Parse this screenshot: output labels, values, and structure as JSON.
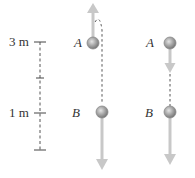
{
  "diagram": {
    "scale": {
      "top_label": "3 m",
      "mid_label": "1 m",
      "ticks": 4
    },
    "panels": [
      {
        "name": "left-panel",
        "point_top_label": "A",
        "point_bottom_label": "B",
        "top_velocity": "up",
        "bottom_velocity": "down",
        "path": "curved-dashed"
      },
      {
        "name": "right-panel",
        "point_top_label": "A",
        "point_bottom_label": "B",
        "top_velocity": "down",
        "bottom_velocity": "down",
        "path": "straight-dashed"
      }
    ],
    "colors": {
      "ball": "#9a9a9a",
      "arrow": "#c8c8c8",
      "text": "#333333",
      "dash": "#555555"
    }
  }
}
